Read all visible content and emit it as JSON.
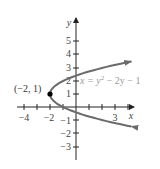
{
  "chart_data": {
    "type": "line",
    "title": "",
    "xlabel": "x",
    "ylabel": "y",
    "xlim": [
      -4.5,
      4.5
    ],
    "ylim": [
      -4,
      6.5
    ],
    "grid": false,
    "x_ticks": [
      -4,
      -3,
      -2,
      -1,
      1,
      2,
      3,
      4
    ],
    "x_tick_labels": {
      "-4": "−4",
      "-2": "−2",
      "3": "3"
    },
    "y_ticks": [
      -3,
      -2,
      -1,
      1,
      2,
      3,
      4,
      5
    ],
    "y_tick_labels": {
      "-3": "−3",
      "-2": "−2",
      "-1": "−1",
      "1": "1",
      "2": "2",
      "3": "3",
      "4": "4",
      "5": "5"
    },
    "series": [
      {
        "name": "x = y² − 2y − 1",
        "equation": "x = y^2 - 2y - 1",
        "color": "#6b6b6b",
        "y_range": [
          -1.5,
          3.5
        ],
        "arrows_both_ends": true
      }
    ],
    "annotations": [
      {
        "label": "(−2, 1)",
        "x": -2,
        "y": 1,
        "marker": "filled-dot"
      },
      {
        "label": "x = y² − 2y − 1",
        "position": "right of curve near y=2"
      }
    ]
  },
  "labels": {
    "x_axis": "x",
    "y_axis": "y",
    "vertex": "(−2, 1)",
    "equation_lhs": "x = y",
    "equation_exp": "2",
    "equation_rhs": " − 2y − 1",
    "xt_m4": "−4",
    "xt_m2": "−2",
    "xt_3": "3",
    "yt_5": "5",
    "yt_4": "4",
    "yt_3": "3",
    "yt_2": "2",
    "yt_1": "1",
    "yt_m1": "−1",
    "yt_m2": "−2",
    "yt_m3": "−3"
  }
}
